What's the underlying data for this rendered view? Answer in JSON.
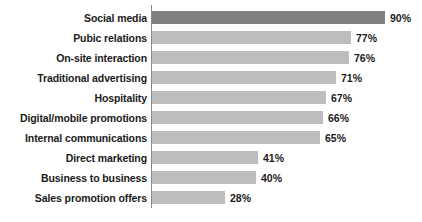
{
  "chart_data": {
    "type": "bar",
    "orientation": "horizontal",
    "title": "",
    "xlabel": "",
    "ylabel": "",
    "xlim": [
      0,
      100
    ],
    "grid": false,
    "legend": null,
    "value_suffix": "%",
    "categories": [
      "Social media",
      "Pubic relations",
      "On-site interaction",
      "Traditional advertising",
      "Hospitality",
      "Digital/mobile promotions",
      "Internal communications",
      "Direct marketing",
      "Business to business",
      "Sales promotion offers"
    ],
    "values": [
      90,
      77,
      76,
      71,
      67,
      66,
      65,
      41,
      40,
      28
    ],
    "value_labels": [
      "90%",
      "77%",
      "76%",
      "71%",
      "67%",
      "66%",
      "65%",
      "41%",
      "40%",
      "28%"
    ],
    "bar_colors": [
      "#808080",
      "#bdbdbd",
      "#bdbdbd",
      "#bdbdbd",
      "#bdbdbd",
      "#bdbdbd",
      "#bdbdbd",
      "#bdbdbd",
      "#bdbdbd",
      "#bdbdbd"
    ],
    "axis_color": "#8a8a8a",
    "text_color": "#1a1a1a",
    "background": "#ffffff"
  }
}
